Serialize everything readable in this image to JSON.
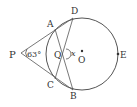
{
  "diagram": {
    "type": "geometry",
    "points": {
      "P": {
        "label": "P",
        "x": 19,
        "y": 53
      },
      "A": {
        "label": "A",
        "x": 55,
        "y": 29
      },
      "D": {
        "label": "D",
        "x": 73,
        "y": 18
      },
      "C": {
        "label": "C",
        "x": 55,
        "y": 79
      },
      "B": {
        "label": "B",
        "x": 73,
        "y": 90
      },
      "Q": {
        "label": "Q",
        "x": 64,
        "y": 54
      },
      "O": {
        "label": "O",
        "x": 82,
        "y": 54
      },
      "E": {
        "label": "E",
        "x": 118,
        "y": 54
      }
    },
    "angle_P": "63°",
    "angle_x": "x",
    "circle": {
      "cx": 82,
      "cy": 54,
      "r": 36
    },
    "stroke_color": "#555555"
  }
}
